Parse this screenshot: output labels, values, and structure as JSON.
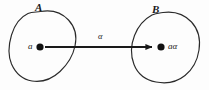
{
  "figure": {
    "type": "set-mapping-diagram",
    "background_color": "#fdfdfd",
    "ink_color": "#1a1a1a"
  },
  "sets": [
    {
      "name": "set-a",
      "label": "A",
      "label_position": {
        "x": 35,
        "y": 2
      },
      "element": {
        "label": "a",
        "label_position": {
          "x": 28,
          "y": 42
        },
        "point": {
          "x": 40,
          "y": 47,
          "radius": 3.6
        }
      }
    },
    {
      "name": "set-b",
      "label": "B",
      "label_position": {
        "x": 152,
        "y": 4
      },
      "element": {
        "label": "aα",
        "label_position": {
          "x": 168,
          "y": 42
        },
        "point": {
          "x": 161,
          "y": 47,
          "radius": 3.6
        }
      }
    }
  ],
  "arrow": {
    "name": "mapping-arrow",
    "label": "α",
    "label_position": {
      "x": 98,
      "y": 32
    },
    "start": {
      "x": 45,
      "y": 47
    },
    "end": {
      "x": 152,
      "y": 47
    },
    "stroke_width": 2.2
  },
  "paths": {
    "blob_a": "M 40.5 11.5 C 52 9.5 62 13 68.5 20 C 75.5 27.5 77 37 75 46 C 73 55.5 67.5 64.5 60 71.5 C 52 79 42 82.5 32 81 C 22.5 79.5 15.5 73 11.5 64 C 8 55.5 8.5 45 11.5 35 C 14.5 25 20.5 17 28 13.5 C 32 11.8 36.2 12.2 40.5 11.5 Z",
    "blob_a_dimple": "M 40.5 11.5 C 44 15.5 48.5 18.5 53.5 18 C 58.5 17.4 63.5 14.2 68.5 20",
    "blob_b": "M 163 12.5 C 174 11 184.5 14.5 191.5 22 C 198.5 29.5 200.5 40 199 50 C 197.5 60 192.5 69.5 185 75.5 C 177 82 166.5 84 156 82 C 145.5 80 137.5 73.5 134 64.5 C 130.5 55.5 131 44.5 134.5 35.5 C 138 26.5 144.5 19 152 15 C 155.5 13.2 159.4 13 163 12.5 Z",
    "blob_b_dimple": "M 163 12.5 C 166 16.5 169.5 20 174 20.5 C 178.5 21 183 18 186 16.5"
  }
}
